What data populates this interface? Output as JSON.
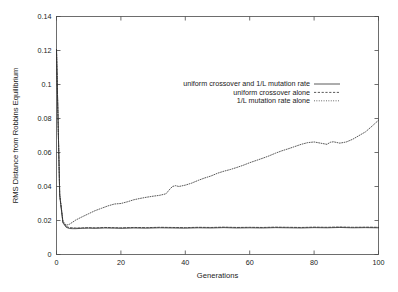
{
  "chart_data": {
    "type": "line",
    "title": "",
    "xlabel": "Generations",
    "ylabel": "RMS Distance from Robbins Equilibrium",
    "xlim": [
      0,
      100
    ],
    "ylim": [
      0,
      0.14
    ],
    "xticks": [
      0,
      20,
      40,
      60,
      80,
      100
    ],
    "xtick_labels": [
      "0",
      "20",
      "40",
      "60",
      "80",
      "100"
    ],
    "yticks": [
      0,
      0.02,
      0.04,
      0.06,
      0.08,
      0.1,
      0.12,
      0.14
    ],
    "ytick_labels": [
      "0",
      "0.02",
      "0.04",
      "0.06",
      "0.08",
      "0.1",
      "0.12",
      "0.14"
    ],
    "grid": false,
    "legend_position": "upper-center",
    "series": [
      {
        "name": "uniform crossover and 1/L mutation rate",
        "style": "solid",
        "x": [
          0,
          1,
          2,
          3,
          4,
          5,
          6,
          8,
          10,
          12,
          15,
          18,
          20,
          24,
          28,
          32,
          36,
          40,
          44,
          48,
          52,
          56,
          60,
          64,
          68,
          72,
          76,
          80,
          84,
          88,
          92,
          96,
          100
        ],
        "values": [
          0.1205,
          0.0345,
          0.0186,
          0.016,
          0.0153,
          0.0152,
          0.0152,
          0.0154,
          0.0155,
          0.0154,
          0.0156,
          0.0155,
          0.0154,
          0.0156,
          0.0155,
          0.0157,
          0.0156,
          0.0155,
          0.0157,
          0.0156,
          0.0158,
          0.0156,
          0.0157,
          0.0156,
          0.0158,
          0.0157,
          0.0156,
          0.0158,
          0.0157,
          0.0159,
          0.0157,
          0.0158,
          0.0157
        ]
      },
      {
        "name": "uniform crossover alone",
        "style": "dashed",
        "x": [
          0,
          1,
          2,
          3,
          4,
          5,
          6,
          8,
          10,
          12,
          15,
          18,
          20,
          24,
          28,
          32,
          36,
          40,
          44,
          48,
          52,
          56,
          60,
          64,
          68,
          72,
          76,
          80,
          84,
          88,
          92,
          96,
          100
        ],
        "values": [
          0.1205,
          0.035,
          0.019,
          0.0165,
          0.0158,
          0.0157,
          0.0156,
          0.0157,
          0.0158,
          0.0157,
          0.0159,
          0.0158,
          0.0157,
          0.0159,
          0.0158,
          0.016,
          0.0159,
          0.0158,
          0.016,
          0.0159,
          0.0161,
          0.0159,
          0.016,
          0.0159,
          0.0161,
          0.016,
          0.0159,
          0.0161,
          0.016,
          0.0162,
          0.016,
          0.0161,
          0.016
        ]
      },
      {
        "name": "1/L mutation rate alone",
        "style": "dotted",
        "x": [
          0,
          1,
          2,
          3,
          4,
          5,
          6,
          8,
          10,
          12,
          14,
          16,
          18,
          20,
          22,
          24,
          26,
          28,
          30,
          32,
          34,
          35,
          36,
          37,
          38,
          40,
          42,
          44,
          46,
          48,
          50,
          52,
          54,
          56,
          58,
          60,
          62,
          64,
          66,
          68,
          70,
          72,
          74,
          76,
          78,
          80,
          82,
          84,
          85,
          86,
          88,
          90,
          92,
          94,
          96,
          98,
          100
        ],
        "values": [
          0.1205,
          0.0355,
          0.0195,
          0.0172,
          0.0178,
          0.019,
          0.0203,
          0.0222,
          0.024,
          0.0258,
          0.0272,
          0.0286,
          0.0297,
          0.03,
          0.031,
          0.0322,
          0.033,
          0.0337,
          0.0343,
          0.0348,
          0.0357,
          0.038,
          0.04,
          0.0405,
          0.04,
          0.0408,
          0.042,
          0.0436,
          0.045,
          0.0462,
          0.0478,
          0.049,
          0.05,
          0.0512,
          0.0525,
          0.054,
          0.0553,
          0.0566,
          0.058,
          0.0596,
          0.061,
          0.0622,
          0.0635,
          0.0648,
          0.0658,
          0.0662,
          0.0655,
          0.0648,
          0.066,
          0.0663,
          0.0655,
          0.0662,
          0.0678,
          0.07,
          0.0722,
          0.0755,
          0.079
        ]
      }
    ]
  },
  "legend": {
    "entries": [
      {
        "label": "uniform crossover and 1/L mutation rate",
        "style": "solid"
      },
      {
        "label": "uniform crossover alone",
        "style": "dashed"
      },
      {
        "label": "1/L mutation rate alone",
        "style": "dotted"
      }
    ]
  }
}
